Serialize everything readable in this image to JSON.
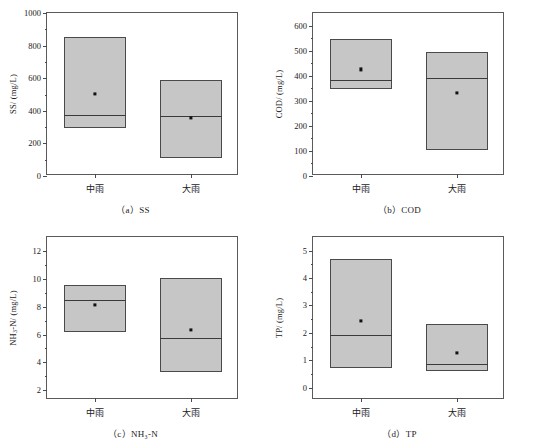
{
  "figure": {
    "panels": [
      {
        "key": "ss",
        "caption": "（a）SS",
        "caption_prefix": "（a）",
        "caption_label": "SS",
        "ylabel_main": "SS/ (mg/L)",
        "ylabel_prefix": "SS",
        "ylabel_suffix": "/ (mg/L)",
        "ylabel_sub": "",
        "ymin": 0,
        "ymax": 1000,
        "ytick_step": 200,
        "yticks": [
          0,
          200,
          400,
          600,
          800,
          1000
        ],
        "ytick_labels": [
          "0",
          "200",
          "400",
          "600",
          "800",
          "1000"
        ],
        "minor_per_major": 2,
        "categories": [
          "中雨",
          "大雨"
        ],
        "boxes": [
          {
            "category": "中雨",
            "top": 855,
            "bottom": 295,
            "median": 375,
            "mean": 505
          },
          {
            "category": "大雨",
            "top": 592,
            "bottom": 112,
            "median": 368,
            "mean": 355
          }
        ]
      },
      {
        "key": "cod",
        "caption": "（b）COD",
        "caption_prefix": "（b）",
        "caption_label": "COD",
        "ylabel_main": "COD/ (mg/L)",
        "ylabel_prefix": "COD",
        "ylabel_suffix": "/ (mg/L)",
        "ylabel_sub": "",
        "ymin": 0,
        "ymax": 650,
        "ytick_step": 100,
        "yticks": [
          0,
          100,
          200,
          300,
          400,
          500,
          600
        ],
        "ytick_labels": [
          "0",
          "100",
          "200",
          "300",
          "400",
          "500",
          "600"
        ],
        "minor_per_major": 2,
        "categories": [
          "中雨",
          "大雨"
        ],
        "boxes": [
          {
            "category": "中雨",
            "top": 548,
            "bottom": 348,
            "median": 382,
            "mean": 425
          },
          {
            "category": "大雨",
            "top": 495,
            "bottom": 105,
            "median": 390,
            "mean": 330
          }
        ]
      },
      {
        "key": "nh3n",
        "caption": "（c）NH₃-N",
        "caption_prefix": "（c）",
        "caption_label": "NH3-N",
        "ylabel_main": "NH₃-N/ (mg/L)",
        "ylabel_prefix": "NH",
        "ylabel_suffix": "-N/ (mg/L)",
        "ylabel_sub": "3",
        "ymin": 1.3,
        "ymax": 13.0,
        "ytick_step": 2,
        "yticks": [
          2,
          4,
          6,
          8,
          10,
          12
        ],
        "ytick_labels": [
          "2",
          "4",
          "6",
          "8",
          "10",
          "12"
        ],
        "minor_per_major": 2,
        "categories": [
          "中雨",
          "大雨"
        ],
        "boxes": [
          {
            "category": "中雨",
            "top": 9.55,
            "bottom": 6.2,
            "median": 8.45,
            "mean": 8.1
          },
          {
            "category": "大雨",
            "top": 10.05,
            "bottom": 3.3,
            "median": 5.75,
            "mean": 6.35
          }
        ]
      },
      {
        "key": "tp",
        "caption": "（d）TP",
        "caption_prefix": "（d）",
        "caption_label": "TP",
        "ylabel_main": "TP/ (mg/L)",
        "ylabel_prefix": "TP",
        "ylabel_suffix": "/ (mg/L)",
        "ylabel_sub": "",
        "ymin": -0.45,
        "ymax": 5.5,
        "ytick_step": 1,
        "yticks": [
          0,
          1,
          2,
          3,
          4,
          5
        ],
        "ytick_labels": [
          "0",
          "1",
          "2",
          "3",
          "4",
          "5"
        ],
        "minor_per_major": 2,
        "categories": [
          "中雨",
          "大雨"
        ],
        "boxes": [
          {
            "category": "中雨",
            "top": 4.68,
            "bottom": 0.73,
            "median": 1.92,
            "mean": 2.43
          },
          {
            "category": "大雨",
            "top": 2.33,
            "bottom": 0.62,
            "median": 0.88,
            "mean": 1.28
          }
        ]
      }
    ],
    "colors": {
      "box_fill": "#c6c6c6",
      "box_edge": "#4a4a4a",
      "median_line": "#3a3a3a",
      "mean_marker": "#111111",
      "frame": "#5a5a5a",
      "background": "#ffffff"
    }
  },
  "chart_data": [
    {
      "type": "box",
      "title": "（a）SS",
      "xlabel": "",
      "ylabel": "SS/ (mg/L)",
      "ylim": [
        0,
        1000
      ],
      "yticks": [
        0,
        200,
        400,
        600,
        800,
        1000
      ],
      "grid": false,
      "legend": "none",
      "categories": [
        "中雨",
        "大雨"
      ],
      "boxes": [
        {
          "category": "中雨",
          "upper": 855,
          "lower": 295,
          "median": 375,
          "mean": 505
        },
        {
          "category": "大雨",
          "upper": 592,
          "lower": 112,
          "median": 368,
          "mean": 355
        }
      ]
    },
    {
      "type": "box",
      "title": "（b）COD",
      "xlabel": "",
      "ylabel": "COD/ (mg/L)",
      "ylim": [
        0,
        650
      ],
      "yticks": [
        0,
        100,
        200,
        300,
        400,
        500,
        600
      ],
      "grid": false,
      "legend": "none",
      "categories": [
        "中雨",
        "大雨"
      ],
      "boxes": [
        {
          "category": "中雨",
          "upper": 548,
          "lower": 348,
          "median": 382,
          "mean": 425
        },
        {
          "category": "大雨",
          "upper": 495,
          "lower": 105,
          "median": 390,
          "mean": 330
        }
      ]
    },
    {
      "type": "box",
      "title": "（c）NH₃-N",
      "xlabel": "",
      "ylabel": "NH₃-N/ (mg/L)",
      "ylim": [
        1.3,
        13.0
      ],
      "yticks": [
        2,
        4,
        6,
        8,
        10,
        12
      ],
      "grid": false,
      "legend": "none",
      "categories": [
        "中雨",
        "大雨"
      ],
      "boxes": [
        {
          "category": "中雨",
          "upper": 9.55,
          "lower": 6.2,
          "median": 8.45,
          "mean": 8.1
        },
        {
          "category": "大雨",
          "upper": 10.05,
          "lower": 3.3,
          "median": 5.75,
          "mean": 6.35
        }
      ]
    },
    {
      "type": "box",
      "title": "（d）TP",
      "xlabel": "",
      "ylabel": "TP/ (mg/L)",
      "ylim": [
        -0.45,
        5.5
      ],
      "yticks": [
        0,
        1,
        2,
        3,
        4,
        5
      ],
      "grid": false,
      "legend": "none",
      "categories": [
        "中雨",
        "大雨"
      ],
      "boxes": [
        {
          "category": "中雨",
          "upper": 4.68,
          "lower": 0.73,
          "median": 1.92,
          "mean": 2.43
        },
        {
          "category": "大雨",
          "upper": 2.33,
          "lower": 0.62,
          "median": 0.88,
          "mean": 1.28
        }
      ]
    }
  ]
}
